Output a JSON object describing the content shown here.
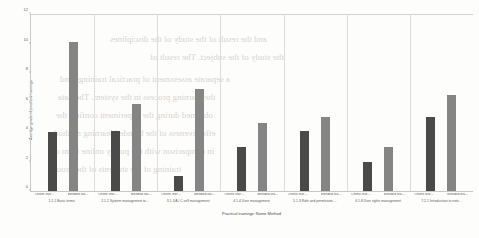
{
  "chart_data": {
    "type": "bar",
    "title": "",
    "xlabel": "Practical trainings: Name Method",
    "ylabel": "Average grade of practical trainings",
    "ylim": [
      0,
      12
    ],
    "yticks": [
      0,
      2,
      4,
      6,
      8,
      10,
      12
    ],
    "ytick_labels": [
      "0",
      "2",
      "4",
      "6",
      "8",
      "10",
      "12"
    ],
    "grid": false,
    "legend_position": "none",
    "categories": [
      "1.1-1 Basic terms",
      "2.1-2 System management to...",
      "3.1-3 A / C self management",
      "4.1-4 User management",
      "5.1-3 Role and permission ...",
      "6.1-8 User rights management",
      "7.2-1 Introduction to exte..."
    ],
    "series": [
      {
        "name": "Online learning",
        "color": "#4a4a4a",
        "short_label": "Online learn...",
        "values": [
          4.0,
          4.1,
          1.0,
          3.0,
          4.1,
          2.0,
          5.0
        ]
      },
      {
        "name": "blended learning",
        "color": "#858585",
        "short_label": "blended lear...",
        "values": [
          10.1,
          5.9,
          6.9,
          4.6,
          5.0,
          3.0,
          6.5
        ]
      }
    ]
  },
  "background_text": [
    "and the result of the study of the disciplines",
    "the study of the subject. The result of",
    "a separate assessment of practical trainings and",
    "the learning process in the system. The data",
    "obtained during the experiment confirm the",
    "effectiveness of the blended learning method",
    "in comparison with the purely online form of",
    "training of the students of the group."
  ]
}
